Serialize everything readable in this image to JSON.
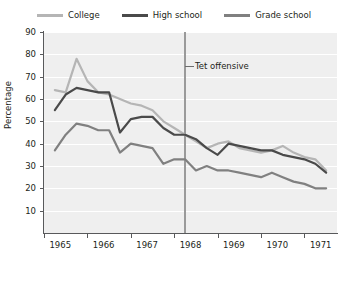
{
  "chart_data": {
    "type": "line",
    "title": "",
    "xlabel": "",
    "ylabel": "Percentage",
    "xlim": [
      1964.75,
      1971.5
    ],
    "ylim": [
      0,
      90
    ],
    "yticks": [
      10,
      20,
      30,
      40,
      50,
      60,
      70,
      80,
      90
    ],
    "xticks": [
      1965,
      1966,
      1967,
      1968,
      1969,
      1970,
      1971
    ],
    "xtick_labels": [
      "1965",
      "1966",
      "1967",
      "1968",
      "1969",
      "1970",
      "1971"
    ],
    "grid": true,
    "legend_position": "top",
    "annotations": [
      {
        "name": "tet-offensive",
        "label": "Tet offensive",
        "x": 1968.0,
        "type": "vertical-line",
        "color": "#9a9a9a"
      }
    ],
    "series": [
      {
        "name": "College",
        "color": "#b5b5b5",
        "x": [
          1965.0,
          1965.25,
          1965.5,
          1965.75,
          1966.0,
          1966.25,
          1966.5,
          1966.75,
          1967.0,
          1967.25,
          1967.5,
          1967.75,
          1968.0,
          1968.25,
          1968.5,
          1968.75,
          1969.0,
          1969.25,
          1969.5,
          1969.75,
          1970.0,
          1970.25,
          1970.5,
          1970.75,
          1971.0,
          1971.25
        ],
        "values": [
          64,
          63,
          78,
          68,
          63,
          62,
          60,
          58,
          57,
          55,
          50,
          47,
          44,
          41,
          38,
          40,
          41,
          38,
          37,
          36,
          37,
          39,
          36,
          34,
          33,
          28
        ]
      },
      {
        "name": "High school",
        "color": "#4a4a4a",
        "x": [
          1965.0,
          1965.25,
          1965.5,
          1965.75,
          1966.0,
          1966.25,
          1966.5,
          1966.75,
          1967.0,
          1967.25,
          1967.5,
          1967.75,
          1968.0,
          1968.25,
          1968.5,
          1968.75,
          1969.0,
          1969.25,
          1969.5,
          1969.75,
          1970.0,
          1970.25,
          1970.5,
          1970.75,
          1971.0,
          1971.25
        ],
        "values": [
          55,
          62,
          65,
          64,
          63,
          63,
          45,
          51,
          52,
          52,
          47,
          44,
          44,
          42,
          38,
          35,
          40,
          39,
          38,
          37,
          37,
          35,
          34,
          33,
          31,
          27
        ]
      },
      {
        "name": "Grade school",
        "color": "#808080",
        "x": [
          1965.0,
          1965.25,
          1965.5,
          1965.75,
          1966.0,
          1966.25,
          1966.5,
          1966.75,
          1967.0,
          1967.25,
          1967.5,
          1967.75,
          1968.0,
          1968.25,
          1968.5,
          1968.75,
          1969.0,
          1969.25,
          1969.5,
          1969.75,
          1970.0,
          1970.25,
          1970.5,
          1970.75,
          1971.0,
          1971.25
        ],
        "values": [
          37,
          44,
          49,
          48,
          46,
          46,
          36,
          40,
          39,
          38,
          31,
          33,
          33,
          28,
          30,
          28,
          28,
          27,
          26,
          25,
          27,
          25,
          23,
          22,
          20,
          20
        ]
      }
    ]
  },
  "legend": {
    "items": [
      {
        "label": "College",
        "color": "#b5b5b5"
      },
      {
        "label": "High school",
        "color": "#4a4a4a"
      },
      {
        "label": "Grade school",
        "color": "#808080"
      }
    ]
  },
  "colors": {
    "plot_background": "#efefef",
    "gridline": "#ffffff",
    "axis": "#58595b",
    "text": "#231f20",
    "page_background": "#ffffff"
  }
}
